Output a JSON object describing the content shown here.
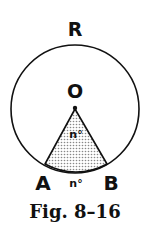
{
  "diagram": {
    "circle": {
      "cx": 75,
      "cy": 109,
      "r": 64
    },
    "center_label": "O",
    "major_arc_label": "R",
    "point_a_label": "A",
    "point_b_label": "B",
    "central_angle_label": "n°",
    "minor_arc_label": "n°",
    "caption": "Fig. 8–16",
    "colors": {
      "stroke": "#111111",
      "shade": "#cfcfcf",
      "background": "#ffffff"
    }
  }
}
